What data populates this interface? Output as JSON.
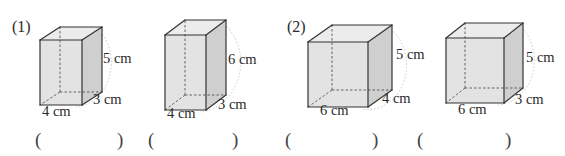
{
  "questions": [
    {
      "number": "(1)"
    },
    {
      "number": "(2)"
    }
  ],
  "prisms": [
    {
      "group": "(1)",
      "height_label": "5 cm",
      "depth_label": "3 cm",
      "width_label": "4 cm"
    },
    {
      "group": "(1)",
      "height_label": "6 cm",
      "depth_label": "3 cm",
      "width_label": "4 cm"
    },
    {
      "group": "(2)",
      "height_label": "5 cm",
      "depth_label": "4 cm",
      "width_label": "6 cm"
    },
    {
      "group": "(2)",
      "height_label": "5 cm",
      "depth_label": "3 cm",
      "width_label": "6 cm"
    }
  ],
  "answers": [
    {
      "open": "(",
      "value": "",
      "close": ")"
    },
    {
      "open": "(",
      "value": "",
      "close": ")"
    },
    {
      "open": "(",
      "value": "",
      "close": ")"
    },
    {
      "open": "(",
      "value": "",
      "close": ")"
    }
  ],
  "colors": {
    "front_face": "#e3e3e3",
    "side_face": "#cfcfcf",
    "top_face": "#ececec",
    "edge": "#333333",
    "hidden_edge": "#555555",
    "arc": "#c8c8c8"
  }
}
